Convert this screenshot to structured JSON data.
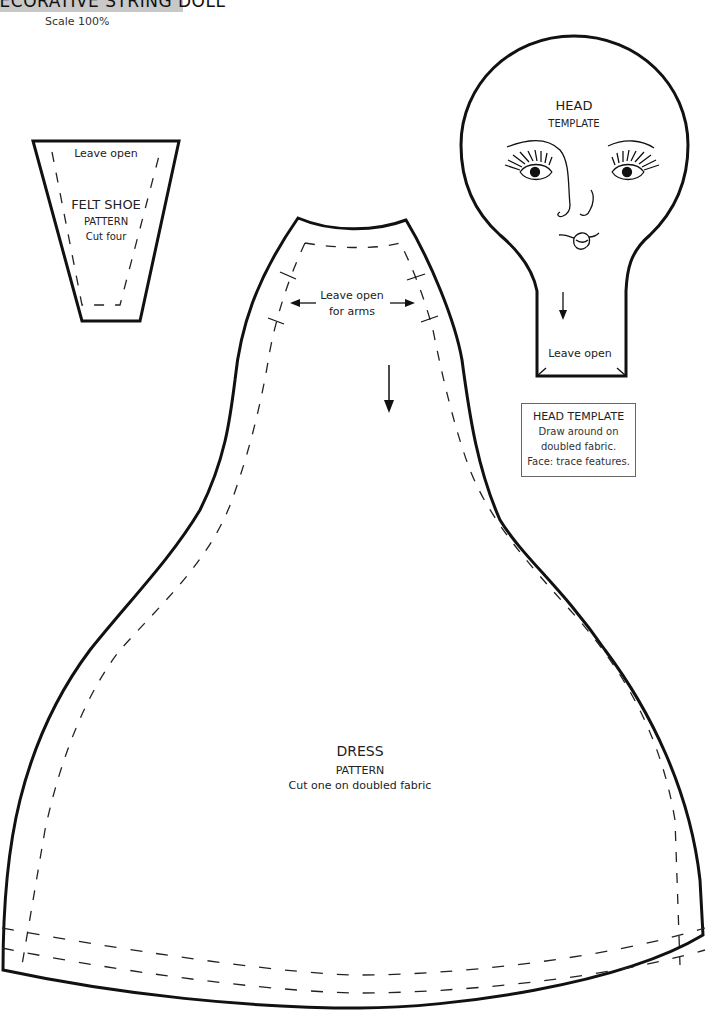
{
  "header": {
    "title": "DECORATIVE STRING DOLL",
    "scale": "Scale 100%"
  },
  "felt_shoe": {
    "opening_note": "Leave open",
    "title": "FELT SHOE",
    "subtitle": "PATTERN",
    "instruction": "Cut four"
  },
  "head_template": {
    "title": "HEAD",
    "subtitle": "TEMPLATE",
    "opening_note": "Leave open"
  },
  "head_info_box": {
    "title": "HEAD TEMPLATE",
    "lines": [
      "Draw around on",
      "doubled fabric.",
      "Face: trace features."
    ]
  },
  "dress": {
    "arm_note_line1": "Leave open",
    "arm_note_line2": "for arms",
    "title": "DRESS",
    "subtitle": "PATTERN",
    "instruction": "Cut one on doubled fabric"
  },
  "colors": {
    "outline": "#111111",
    "header_band": "#c8c8c8",
    "background": "#ffffff"
  }
}
